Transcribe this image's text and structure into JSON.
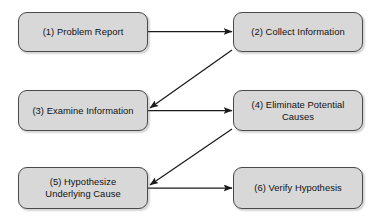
{
  "diagram": {
    "type": "flowchart",
    "title": "",
    "canvas": {
      "width": 380,
      "height": 220,
      "background": "#ffffff"
    },
    "style": {
      "node_fill": "#d8d8d8",
      "node_border": "#4a4a4a",
      "arrow_color": "#1a1a1a",
      "text_color": "#111111"
    },
    "nodes": [
      {
        "id": "1",
        "label": "(1) Problem Report",
        "column": "left",
        "row": 1
      },
      {
        "id": "2",
        "label": "(2) Collect Information",
        "column": "right",
        "row": 1
      },
      {
        "id": "3",
        "label": "(3) Examine Information",
        "column": "left",
        "row": 2
      },
      {
        "id": "4",
        "label": "(4) Eliminate Potential\nCauses",
        "column": "right",
        "row": 2
      },
      {
        "id": "5",
        "label": "(5) Hypothesize\nUnderlying Cause",
        "column": "left",
        "row": 3
      },
      {
        "id": "6",
        "label": "(6) Verify Hypothesis",
        "column": "right",
        "row": 3
      }
    ],
    "edges": [
      {
        "from": "1",
        "to": "2",
        "shape": "horizontal",
        "arrowhead": "end"
      },
      {
        "from": "2",
        "to": "3",
        "shape": "diagonal",
        "arrowhead": "end"
      },
      {
        "from": "3",
        "to": "4",
        "shape": "horizontal",
        "arrowhead": "end"
      },
      {
        "from": "4",
        "to": "5",
        "shape": "diagonal",
        "arrowhead": "end"
      },
      {
        "from": "5",
        "to": "6",
        "shape": "horizontal",
        "arrowhead": "end"
      }
    ]
  }
}
